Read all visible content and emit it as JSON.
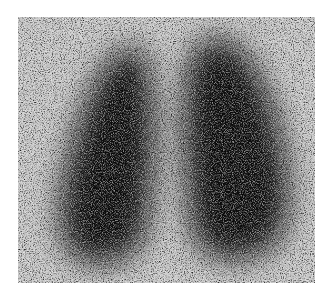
{
  "image": {
    "description": "Grayscale nuclear medicine lung perfusion scan showing two dark lung silhouettes on a noisy speckled background",
    "background_color": "#ffffff",
    "field_color": "#c4c4c4",
    "dark_color": "#0a0a0a",
    "regions": [
      {
        "name": "left-lung",
        "cx": 88,
        "cy": 140,
        "rx": 52,
        "ry": 108
      },
      {
        "name": "right-lung",
        "cx": 200,
        "cy": 130,
        "rx": 68,
        "ry": 112
      }
    ]
  }
}
